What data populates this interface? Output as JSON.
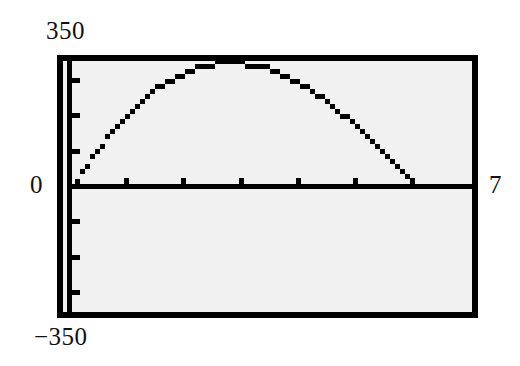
{
  "figure": {
    "kind": "graphing-calculator-plot",
    "background_color": "#ffffff",
    "plot_background_color": "#f1f1f1",
    "frame_color": "#000000",
    "ink_color": "#000000"
  },
  "labels": {
    "y_max": "350",
    "y_min": "−350",
    "x_min": "0",
    "x_max": "7"
  },
  "chart_data": {
    "type": "line",
    "title": "",
    "subtitle": "",
    "xlabel": "",
    "ylabel": "",
    "xlim": [
      0,
      7
    ],
    "ylim": [
      -350,
      350
    ],
    "grid": false,
    "legend": null,
    "legend_position": "none",
    "axis_style": "calculator-window",
    "x_axis_value": 0,
    "y_axis_value": 0,
    "x_tick_interval": 1,
    "y_tick_interval": 100,
    "x_tick_values": [
      1,
      2,
      3,
      4,
      5,
      6
    ],
    "y_tick_values": [
      100,
      200,
      300,
      -100,
      -200,
      -300
    ],
    "x_tick_count": 6,
    "y_tick_count_above_axis": 3,
    "y_tick_count_below_axis": 3,
    "render_style": "stepped-pixel-trace",
    "annotations": [],
    "series": [
      {
        "name": "curve",
        "x": [
          0.0,
          0.25,
          0.5,
          0.75,
          1.0,
          1.25,
          1.5,
          1.75,
          2.0,
          2.25,
          2.5,
          2.75,
          3.0,
          3.25,
          3.5,
          3.75,
          4.0,
          4.25,
          4.5,
          4.75,
          5.0,
          5.25,
          5.5,
          5.75,
          6.0,
          6.25,
          6.5,
          6.75,
          7.0
        ],
        "values": [
          0,
          61,
          116,
          166,
          210,
          248,
          280,
          306,
          326,
          341,
          349,
          352,
          350,
          343,
          331,
          314,
          292,
          266,
          236,
          202,
          165,
          126,
          85,
          43,
          2,
          -40,
          -80,
          -116,
          -150
        ]
      }
    ],
    "visible_trace_note": "Only the portion of the curve at or above y=0 is drawn; it rises from the origin, peaks near x=2.75 at about y=350, and returns to y=0 near x=7."
  }
}
